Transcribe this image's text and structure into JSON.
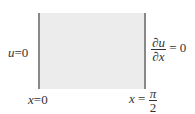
{
  "diagram": {
    "region": {
      "fill": "#ececec",
      "boundary_color": "#888888"
    },
    "left_boundary": {
      "condition": {
        "var": "u",
        "eq": "=",
        "value": "0"
      },
      "position": {
        "var": "x",
        "eq": "=",
        "value": "0"
      }
    },
    "right_boundary": {
      "condition": {
        "num": "∂u",
        "den": "∂x",
        "eq": "=",
        "value": "0"
      },
      "position": {
        "var": "x",
        "eq": "=",
        "num": "π",
        "den": "2"
      }
    }
  }
}
